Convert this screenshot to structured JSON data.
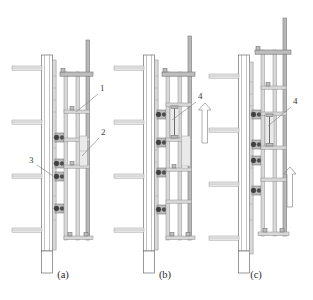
{
  "figure": {
    "background_color": "#ffffff",
    "line_color": "#6e6e6e",
    "accent_color": "#3f3f3f",
    "panel_count": 3
  },
  "panels": [
    {
      "id": "a",
      "caption": "(a)",
      "caption_x": 63,
      "caption_y": 278,
      "stage_description": "Initial assembled position of climbing frame anchored to wall",
      "callouts": [
        {
          "number": "1",
          "label_x": 100,
          "label_y": 91,
          "leader_from_x": 98,
          "leader_from_y": 94,
          "leader_to_x": 76,
          "leader_to_y": 112,
          "points_to": "outer vertical guide rail / mast"
        },
        {
          "number": "2",
          "label_x": 101,
          "label_y": 135,
          "leader_from_x": 99,
          "leader_from_y": 138,
          "leader_to_x": 82,
          "leader_to_y": 156,
          "points_to": "working platform bracket / climbing shoe frame"
        },
        {
          "number": "3",
          "label_x": 32,
          "label_y": 163,
          "leader_from_x": 37,
          "leader_from_y": 165,
          "leader_to_x": 53,
          "leader_to_y": 176,
          "points_to": "wall anchor bolt assembly"
        }
      ]
    },
    {
      "id": "b",
      "caption": "(b)",
      "caption_x": 165,
      "caption_y": 278,
      "stage_description": "Hydraulic jack extends, lifting guide rail one storey",
      "callouts": [
        {
          "number": "4",
          "label_x": 198,
          "label_y": 99,
          "leader_from_x": 196,
          "leader_from_y": 102,
          "leader_to_x": 172,
          "leader_to_y": 120,
          "points_to": "hydraulic climbing jack / cylinder"
        }
      ],
      "motion_arrow": {
        "direction": "up",
        "x": 205,
        "y_top": 104,
        "y_bottom": 143
      }
    },
    {
      "id": "c",
      "caption": "(c)",
      "caption_x": 256,
      "caption_y": 278,
      "stage_description": "Whole climbing unit raised to next pour level",
      "callouts": [
        {
          "number": "4",
          "label_x": 293,
          "label_y": 104,
          "leader_from_x": 291,
          "leader_from_y": 107,
          "leader_to_x": 268,
          "leader_to_y": 126,
          "points_to": "hydraulic climbing jack / cylinder"
        }
      ],
      "motion_arrow": {
        "direction": "up",
        "x": 290,
        "y_top": 168,
        "y_bottom": 207
      }
    }
  ],
  "legend_keys": [
    {
      "number": "1",
      "meaning": "guide rail / mast"
    },
    {
      "number": "2",
      "meaning": "platform bracket"
    },
    {
      "number": "3",
      "meaning": "wall anchor bolt"
    },
    {
      "number": "4",
      "meaning": "hydraulic jack"
    }
  ]
}
